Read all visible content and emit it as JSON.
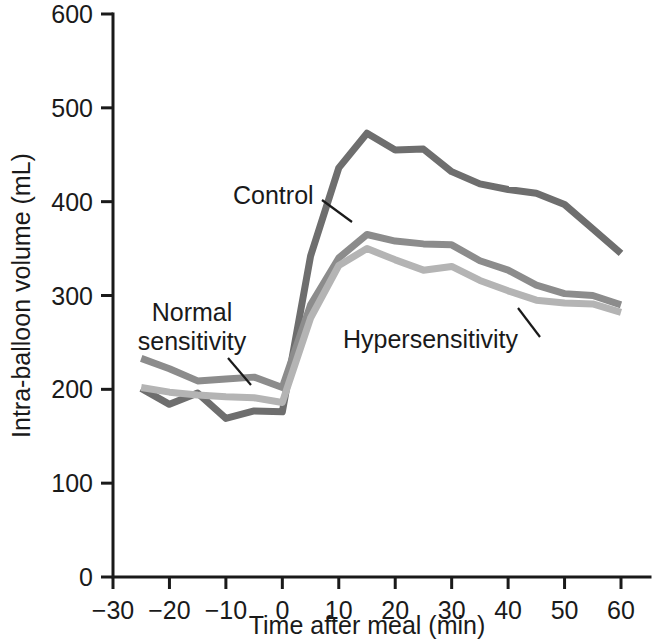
{
  "chart_data": {
    "type": "line",
    "title": "",
    "subtitle": "",
    "xlabel": "Time after meal (min)",
    "ylabel": "Intra-balloon volume (mL)",
    "xlim": [
      -30,
      60
    ],
    "ylim": [
      0,
      600
    ],
    "xticks": [
      -30,
      -20,
      -10,
      0,
      10,
      20,
      30,
      40,
      50,
      60
    ],
    "xticklabels": [
      "−30",
      "−20",
      "−10",
      "0",
      "10",
      "20",
      "30",
      "40",
      "50",
      "60"
    ],
    "yticks": [
      0,
      100,
      200,
      300,
      400,
      500,
      600
    ],
    "yticklabels": [
      "0",
      "100",
      "200",
      "300",
      "400",
      "500",
      "600"
    ],
    "grid": false,
    "legend_position": "inline-annotations",
    "x": [
      -25,
      -20,
      -15,
      -10,
      -5,
      0,
      5,
      10,
      15,
      20,
      25,
      30,
      35,
      40,
      45,
      50,
      55,
      60
    ],
    "series": [
      {
        "name": "Control",
        "color": "#6e6e6e",
        "values": [
          201,
          184,
          196,
          169,
          177,
          176,
          342,
          436,
          473,
          455,
          456,
          432,
          419,
          413,
          409,
          397,
          371,
          345
        ]
      },
      {
        "name": "Normal sensitivity",
        "color": "#8c8c8c",
        "values": [
          233,
          222,
          209,
          211,
          213,
          202,
          290,
          340,
          365,
          358,
          355,
          354,
          337,
          327,
          311,
          302,
          300,
          290
        ]
      },
      {
        "name": "Hypersensitivity",
        "color": "#b4b4b4",
        "values": [
          202,
          197,
          194,
          192,
          191,
          186,
          276,
          332,
          350,
          338,
          327,
          331,
          316,
          305,
          295,
          292,
          291,
          282
        ]
      }
    ],
    "annotations": [
      {
        "label": "Control",
        "target_x": 6,
        "target_y": 400
      },
      {
        "label": "Normal sensitivity",
        "target_x": -3,
        "target_y": 205
      },
      {
        "label": "Hypersensitivity",
        "target_x": 45,
        "target_y": 297
      }
    ]
  },
  "labels": {
    "control": "Control",
    "normal_line1": "Normal",
    "normal_line2": "sensitivity",
    "hypersensitivity": "Hypersensitivity"
  }
}
